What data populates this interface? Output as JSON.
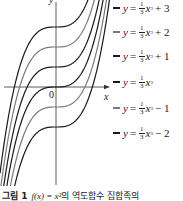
{
  "figure": {
    "caption": {
      "number_label": "그림 1",
      "function_text": "f(x) = x²",
      "rest_text": "의 역도함수 집합족의"
    },
    "axes": {
      "x_label": "x",
      "y_label": "y",
      "origin_label": "0"
    },
    "legend": [
      {
        "lhs": "y",
        "eq": "=",
        "num": "1",
        "den": "3",
        "var": "x",
        "exp": "3",
        "const": "+ 3",
        "color": "#1a1a1a"
      },
      {
        "lhs": "y",
        "eq": "=",
        "num": "1",
        "den": "3",
        "var": "x",
        "exp": "3",
        "const": "+ 2",
        "color": "#7a7a7a"
      },
      {
        "lhs": "y",
        "eq": "=",
        "num": "1",
        "den": "3",
        "var": "x",
        "exp": "3",
        "const": "+ 1",
        "color": "#1a1a1a"
      },
      {
        "lhs": "y",
        "eq": "=",
        "num": "1",
        "den": "3",
        "var": "x",
        "exp": "3",
        "const": "",
        "color": "#1a1a1a"
      },
      {
        "lhs": "y",
        "eq": "=",
        "num": "1",
        "den": "3",
        "var": "x",
        "exp": "3",
        "const": "− 1",
        "color": "#7a7a7a"
      },
      {
        "lhs": "y",
        "eq": "=",
        "num": "1",
        "den": "3",
        "var": "x",
        "exp": "3",
        "const": "− 2",
        "color": "#1a1a1a"
      }
    ]
  },
  "chart_data": {
    "type": "line",
    "xlabel": "x",
    "ylabel": "y",
    "function_family": "y = (1/3)x^3 + C",
    "series": [
      {
        "name": "y = (1/3)x^3 + 3",
        "C": 3,
        "color": "#1a1a1a"
      },
      {
        "name": "y = (1/3)x^3 + 2",
        "C": 2,
        "color": "#7a7a7a"
      },
      {
        "name": "y = (1/3)x^3 + 1",
        "C": 1,
        "color": "#1a1a1a"
      },
      {
        "name": "y = (1/3)x^3",
        "C": 0,
        "color": "#1a1a1a"
      },
      {
        "name": "y = (1/3)x^3 - 1",
        "C": -1,
        "color": "#7a7a7a"
      },
      {
        "name": "y = (1/3)x^3 - 2",
        "C": -2,
        "color": "#1a1a1a"
      }
    ],
    "xlim": [
      -2.6,
      2.6
    ],
    "ylim": [
      -4.9,
      4.35
    ],
    "grid": false,
    "legend_position": "right",
    "origin_px": [
      56,
      87
    ],
    "px_per_unit": 20
  }
}
